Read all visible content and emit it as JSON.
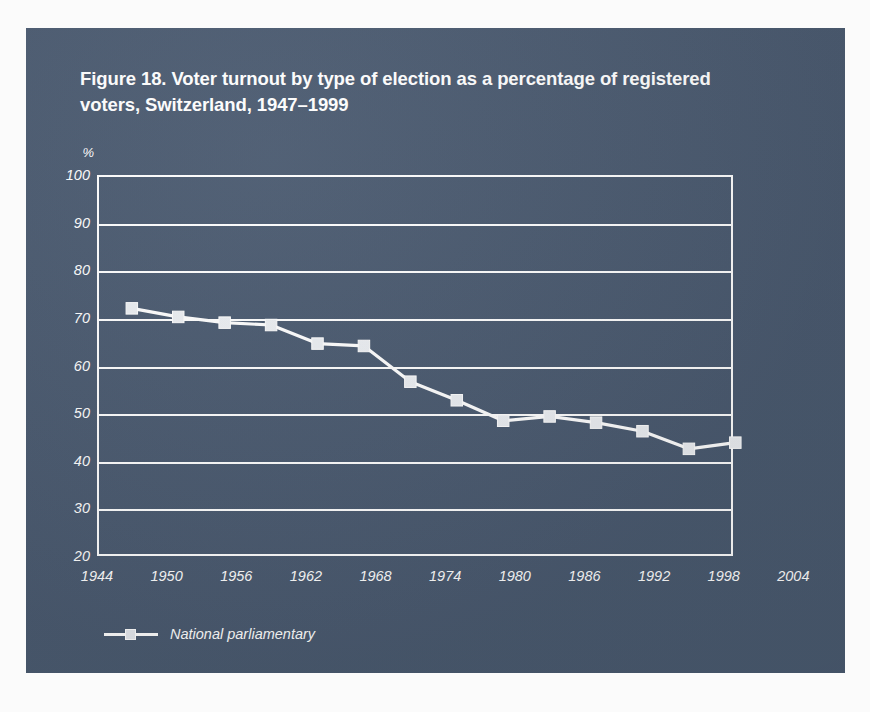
{
  "figure": {
    "title": "Figure 18. Voter turnout by type of election as a percentage of registered voters, Switzerland, 1947–1999",
    "panel_color": "#4a5a70",
    "ink_color": "#ffffff"
  },
  "chart_data": {
    "type": "line",
    "title": "Figure 18. Voter turnout by type of election as a percentage of registered voters, Switzerland, 1947–1999",
    "xlabel": "",
    "ylabel": "%",
    "y_unit": "%",
    "xlim": [
      1944,
      2004
    ],
    "ylim": [
      20,
      100
    ],
    "grid": true,
    "legend_position": "bottom-left",
    "x_ticks": [
      1944,
      1950,
      1956,
      1962,
      1968,
      1974,
      1980,
      1986,
      1992,
      1998,
      2004
    ],
    "y_ticks": [
      20,
      30,
      40,
      50,
      60,
      70,
      80,
      90,
      100
    ],
    "x_tick_labels": [
      "1944",
      "1950",
      "1956",
      "1962",
      "1968",
      "1974",
      "1980",
      "1986",
      "1992",
      "1998",
      "2004"
    ],
    "y_tick_labels": [
      "20",
      "30",
      "40",
      "50",
      "60",
      "70",
      "80",
      "90",
      "100"
    ],
    "marker": "square",
    "series": [
      {
        "name": "National parliamentary",
        "color": "#ffffff",
        "x": [
          1947,
          1951,
          1955,
          1959,
          1963,
          1967,
          1971,
          1975,
          1979,
          1983,
          1987,
          1991,
          1995,
          1999
        ],
        "values": [
          72.0,
          70.2,
          69.0,
          68.5,
          64.6,
          64.1,
          56.6,
          52.7,
          48.4,
          49.3,
          48.0,
          46.2,
          42.5,
          43.8
        ]
      }
    ]
  },
  "legend": {
    "entries": [
      {
        "label": "National parliamentary",
        "marker": "square-marker",
        "color": "#ffffff"
      }
    ]
  }
}
